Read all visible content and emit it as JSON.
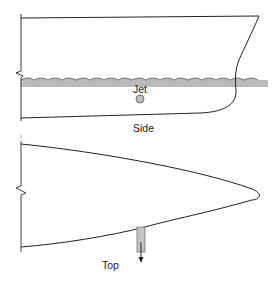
{
  "figure": {
    "views": [
      {
        "id": "side",
        "label": "Side"
      },
      {
        "id": "top",
        "label": "Top"
      }
    ],
    "labels": {
      "jet": "Jet",
      "side": "Side",
      "top": "Top"
    },
    "colors": {
      "line": "#222222",
      "water": "#b9b9b9",
      "jet_fill": "#bdbdbd",
      "jet_tube": "#c4c4c4",
      "background": "#ffffff"
    }
  }
}
